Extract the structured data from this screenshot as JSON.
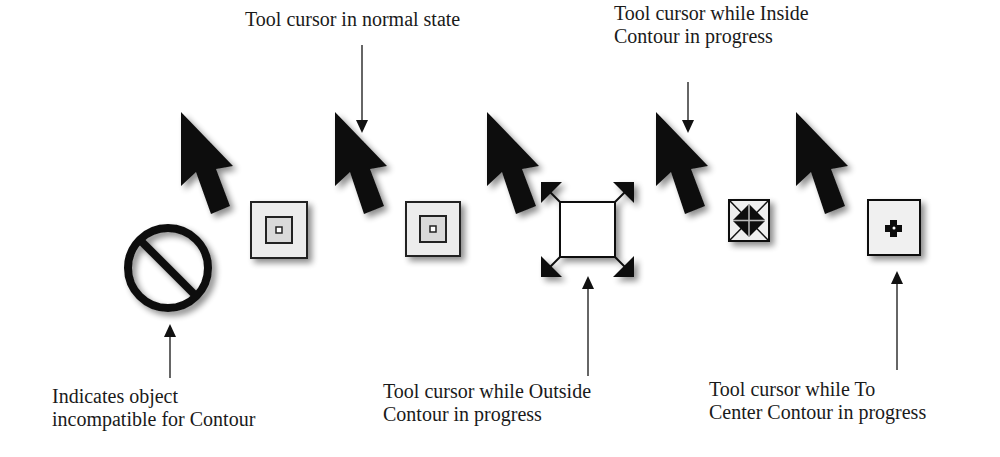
{
  "diagram": {
    "labels": {
      "incompatible": [
        "Indicates object",
        "incompatible for Contour"
      ],
      "normal": [
        "Tool cursor in normal state"
      ],
      "inside": [
        "Tool cursor while Inside",
        "Contour in progress"
      ],
      "outside": [
        "Tool cursor while Outside",
        "Contour in progress"
      ],
      "center": [
        "Tool cursor while To",
        "Center Contour in progress"
      ]
    },
    "cursors": [
      {
        "id": "incompatible",
        "icon": "prohibited-circle-icon"
      },
      {
        "id": "normal",
        "icon": "nested-squares-icon"
      },
      {
        "id": "outside",
        "icon": "expand-square-icon"
      },
      {
        "id": "inside",
        "icon": "contract-square-icon"
      },
      {
        "id": "center",
        "icon": "center-cross-icon"
      }
    ],
    "colors": {
      "ink": "#111111",
      "shadow": "#c8c8c8",
      "icon_fill": "#e6e6e6"
    }
  }
}
